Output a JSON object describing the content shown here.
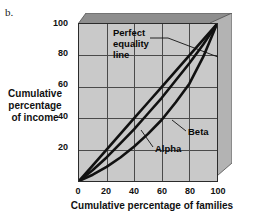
{
  "figure": {
    "label": "b."
  },
  "chart_data": {
    "type": "line",
    "title": "",
    "xlabel": "Cumulative percentage of families",
    "ylabel": "Cumulative percentage of income",
    "xlim": [
      0,
      100
    ],
    "ylim": [
      0,
      100
    ],
    "grid": true,
    "legend_position": "inline-annotations",
    "x_ticks": [
      "0",
      "20",
      "40",
      "60",
      "80",
      "100"
    ],
    "x_tick_values": [
      0,
      20,
      40,
      60,
      80,
      100
    ],
    "y_ticks": [
      "20",
      "40",
      "60",
      "80",
      "100"
    ],
    "y_tick_values": [
      20,
      40,
      60,
      80,
      100
    ],
    "x": [
      0,
      10,
      20,
      30,
      40,
      50,
      60,
      70,
      80,
      90,
      100
    ],
    "series": [
      {
        "name": "Perfect equality line",
        "values": [
          0,
          10,
          20,
          30,
          40,
          50,
          60,
          70,
          80,
          90,
          100
        ]
      },
      {
        "name": "Beta",
        "values": [
          0,
          7,
          15,
          24,
          33,
          43,
          53,
          64,
          75,
          87,
          100
        ]
      },
      {
        "name": "Alpha",
        "values": [
          0,
          4,
          9,
          15,
          22,
          30,
          39,
          50,
          62,
          79,
          100
        ]
      }
    ],
    "annotations": [
      {
        "name": "perfect-equality",
        "lines": [
          "Perfect",
          "equality",
          "line"
        ],
        "points_to": [
          100,
          82
        ]
      },
      {
        "name": "beta",
        "lines": [
          "Beta"
        ],
        "points_to": [
          66,
          54
        ]
      },
      {
        "name": "alpha",
        "lines": [
          "Alpha"
        ],
        "points_to": [
          49,
          30
        ]
      }
    ]
  },
  "colors": {
    "plot_background": "#c9c9c9",
    "page_background": "#ffffff",
    "curve": "#111111",
    "gridline": "#4a4a4a",
    "axis": "#2b2b2b",
    "bevel_top": "#8e8e8e",
    "bevel_right": "#b0b0b0",
    "text": "#111111"
  }
}
